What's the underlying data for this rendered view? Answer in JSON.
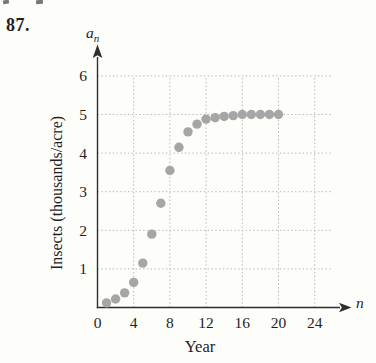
{
  "problem": {
    "number": "87."
  },
  "chart_data": {
    "type": "scatter",
    "title": "",
    "xlabel": "Year",
    "ylabel": "Insects (thousands/acre)",
    "x_symbol": "n",
    "y_symbol_base": "a",
    "y_symbol_sub": "n",
    "x": [
      1,
      2,
      3,
      4,
      5,
      6,
      7,
      8,
      9,
      10,
      11,
      12,
      13,
      14,
      15,
      16,
      17,
      18,
      19,
      20
    ],
    "values": [
      0.12,
      0.22,
      0.38,
      0.65,
      1.15,
      1.9,
      2.7,
      3.55,
      4.15,
      4.55,
      4.75,
      4.88,
      4.92,
      4.95,
      4.97,
      5,
      5,
      5,
      5,
      5
    ],
    "x_ticks": [
      0,
      4,
      8,
      12,
      16,
      20,
      24
    ],
    "y_ticks": [
      1,
      2,
      3,
      4,
      5,
      6
    ],
    "xlim": [
      0,
      27
    ],
    "ylim": [
      0,
      6.8
    ],
    "grid": true,
    "legend": "none",
    "colors": {
      "dot": "#a6a6a6",
      "grid": "#b3bab6",
      "axis": "#2e2e2e",
      "text": "#1f1f1f"
    }
  }
}
